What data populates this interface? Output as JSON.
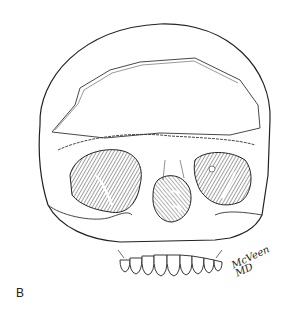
{
  "figure": {
    "panel_label": "B",
    "signature": {
      "name": "McVeen",
      "suffix": "MD"
    },
    "colors": {
      "ink": "#222222",
      "background": "#ffffff",
      "hatch": "#555555"
    }
  }
}
